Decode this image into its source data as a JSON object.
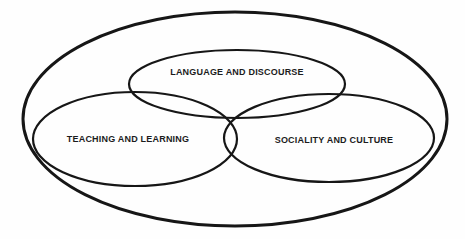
{
  "diagram": {
    "type": "venn-diagram",
    "colors": {
      "background": "#fefefe",
      "stroke": "#161616",
      "text": "#1c1c1c"
    },
    "outer_boundary": {
      "label": ""
    },
    "sets": [
      {
        "id": "language-discourse",
        "label": "LANGUAGE AND DISCOURSE",
        "position": "top"
      },
      {
        "id": "teaching-learning",
        "label": "TEACHING AND LEARNING",
        "position": "bottom-left"
      },
      {
        "id": "sociality-culture",
        "label": "SOCIALITY AND CULTURE",
        "position": "bottom-right"
      }
    ]
  }
}
